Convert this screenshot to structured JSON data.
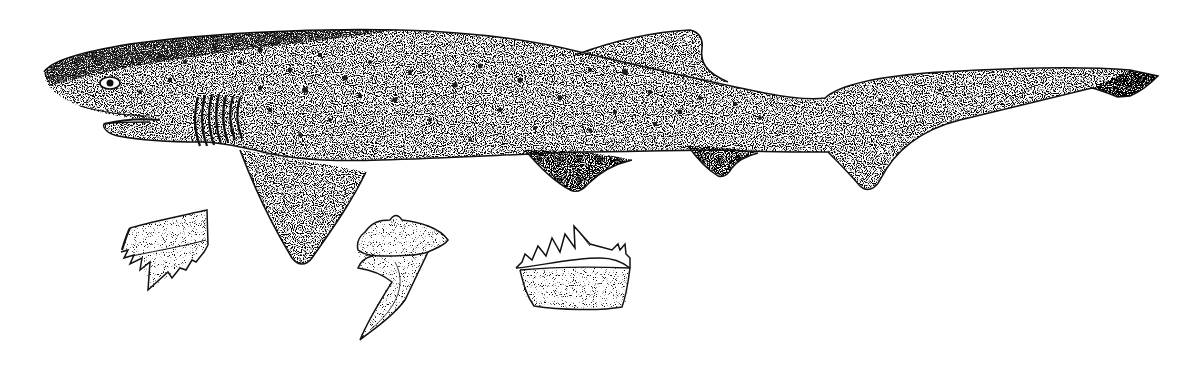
{
  "image": {
    "subject": "Broadnose sevengill shark",
    "style": "stippled pen-and-ink scientific illustration",
    "background_color": "#ffffff",
    "ink_color": "#111111",
    "width": 1193,
    "height": 365
  },
  "figure": {
    "shark": {
      "view": "lateral, facing left",
      "gill_slits": 7,
      "features": [
        "eye",
        "mouth",
        "gill-slits",
        "pectoral-fin",
        "dorsal-fin",
        "pelvic-fin",
        "anal-fin",
        "caudal-fin",
        "dark-spots"
      ]
    },
    "teeth": [
      {
        "label": "upper tooth",
        "position": "left"
      },
      {
        "label": "lateral tooth (side view)",
        "position": "center"
      },
      {
        "label": "lower comb-shaped tooth",
        "position": "right"
      }
    ]
  }
}
